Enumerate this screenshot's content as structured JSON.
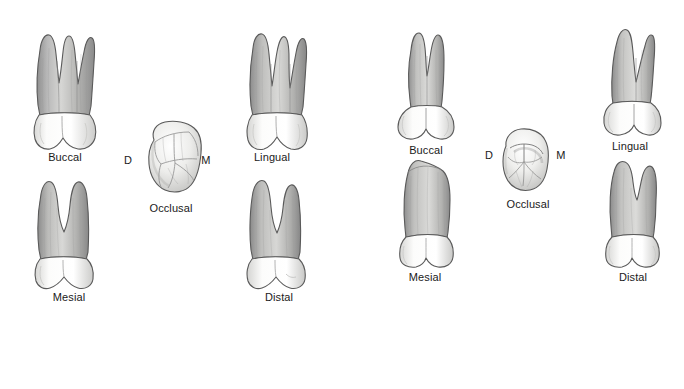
{
  "figure": {
    "background_color": "#ffffff",
    "label_color": "#1a1a1a",
    "enamel_color": "#fbfbfa",
    "root_color": "#a8a8a8",
    "outline_color": "#4a4a4a"
  },
  "groups": [
    {
      "id": "left-tooth",
      "name": "maxillary-first-molar",
      "views": [
        {
          "key": "buccal",
          "label": "Buccal"
        },
        {
          "key": "lingual",
          "label": "Lingual"
        },
        {
          "key": "mesial",
          "label": "Mesial"
        },
        {
          "key": "distal",
          "label": "Distal"
        },
        {
          "key": "occlusal",
          "label": "Occlusal"
        }
      ],
      "occlusal_markers": {
        "distal": "D",
        "mesial": "M"
      }
    },
    {
      "id": "right-tooth",
      "name": "maxillary-second-premolar",
      "views": [
        {
          "key": "buccal",
          "label": "Buccal"
        },
        {
          "key": "lingual",
          "label": "Lingual"
        },
        {
          "key": "mesial",
          "label": "Mesial"
        },
        {
          "key": "distal",
          "label": "Distal"
        },
        {
          "key": "occlusal",
          "label": "Occlusal"
        }
      ],
      "occlusal_markers": {
        "distal": "D",
        "mesial": "M"
      }
    }
  ]
}
